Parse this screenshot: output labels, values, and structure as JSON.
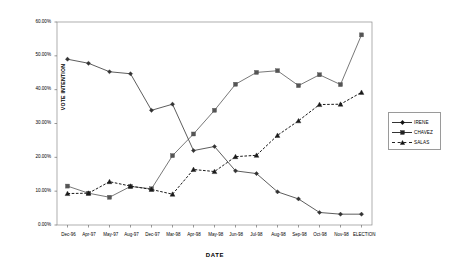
{
  "chart_data": {
    "type": "line",
    "title": "",
    "xlabel": "DATE",
    "ylabel": "VOTE INTENTION",
    "ylim": [
      0,
      60
    ],
    "ytick_labels": [
      "0.00%",
      "10.00%",
      "20.00%",
      "30.00%",
      "40.00%",
      "50.00%",
      "60.00%"
    ],
    "ytick_values": [
      0,
      10,
      20,
      30,
      40,
      50,
      60
    ],
    "grid": false,
    "legend_position": "right",
    "categories": [
      "Dec-96",
      "Apr-97",
      "May-97",
      "Aug-97",
      "Dec-97",
      "Mar-98",
      "Apr-98",
      "May-98",
      "Jun-98",
      "Jul-98",
      "Aug-98",
      "Sep-98",
      "Oct-98",
      "Nov-98",
      "ELECTION"
    ],
    "series": [
      {
        "name": "IRENE",
        "marker": "diamond",
        "line_style": "solid",
        "color": "#333333",
        "values": [
          49.0,
          47.8,
          45.3,
          44.7,
          33.9,
          35.7,
          22.0,
          23.2,
          16.0,
          15.2,
          9.8,
          7.7,
          3.7,
          3.2,
          3.2
        ]
      },
      {
        "name": "CHAVEZ",
        "marker": "square",
        "line_style": "solid",
        "color": "#555555",
        "values": [
          11.5,
          9.4,
          8.2,
          11.4,
          10.7,
          20.5,
          26.9,
          33.9,
          41.6,
          45.1,
          45.6,
          41.2,
          44.4,
          41.5,
          56.2
        ]
      },
      {
        "name": "SALAS",
        "marker": "triangle",
        "line_style": "dashed",
        "color": "#1a1a1a",
        "values": [
          9.3,
          9.4,
          12.8,
          11.5,
          10.5,
          9.1,
          16.4,
          15.8,
          20.2,
          20.6,
          26.5,
          30.8,
          35.6,
          35.7,
          39.2
        ]
      }
    ]
  },
  "legend": {
    "items": [
      {
        "label": "IRENE"
      },
      {
        "label": "CHAVEZ"
      },
      {
        "label": "SALAS"
      }
    ]
  }
}
